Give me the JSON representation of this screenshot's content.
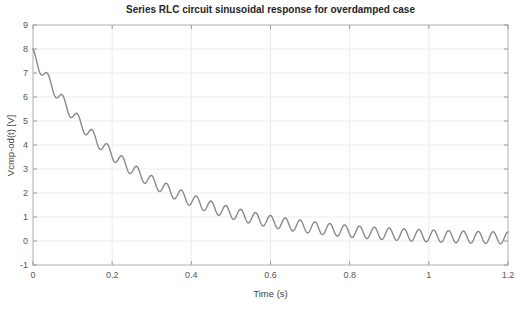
{
  "figure": {
    "kind": "matlab-style-figure",
    "background": "#ffffff"
  },
  "chart_data": {
    "type": "line",
    "title": "Series RLC circuit sinusoidal response for overdamped case",
    "xlabel": "Time (s)",
    "ylabel": "Vcmp-od(t) [V]",
    "xlim": [
      0,
      1.2
    ],
    "ylim": [
      -1,
      9
    ],
    "xticks": [
      0,
      0.2,
      0.4,
      0.6,
      0.8,
      1,
      1.2
    ],
    "xtick_labels": [
      "0",
      "0.2",
      "0.4",
      "0.6",
      "0.8",
      "1",
      "1.2"
    ],
    "yticks": [
      -1,
      0,
      1,
      2,
      3,
      4,
      5,
      6,
      7,
      8,
      9
    ],
    "ytick_labels": [
      "-1",
      "0",
      "1",
      "2",
      "3",
      "4",
      "5",
      "6",
      "7",
      "8",
      "9"
    ],
    "grid": true,
    "legend": "none",
    "series": [
      {
        "name": "Vcmp-od(t)",
        "description": "Decaying exponential transient with constant-amplitude steady-state sinusoid; starts at 8 V, settles oscillating about ~0.05 V",
        "model": "v(t) = A*exp(-t/tau) + offset + amp*sin(2*pi*freq*t + phase)",
        "params": {
          "A": 7.7,
          "tau": 0.26,
          "offset": 0.05,
          "amp": 0.25,
          "freq": 26.67,
          "phase": 1.5708
        },
        "t_start": 0,
        "t_end": 1.2,
        "n_points": 700,
        "midline_samples": {
          "t": [
            0,
            0.2,
            0.4,
            0.6,
            0.8,
            1.0,
            1.2
          ],
          "v": [
            7.75,
            3.68,
            1.77,
            0.88,
            0.45,
            0.24,
            0.13
          ]
        },
        "start_value": 8.0,
        "oscillation_amplitude": 0.25,
        "oscillation_frequency_hz": 26.67
      }
    ]
  },
  "styles": {
    "line_color": "#8a8a8a",
    "line_width": 1.4,
    "grid_color": "#ececec",
    "axis_box_color": "#b0b0b0",
    "tick_color": "#9a9a9a",
    "tick_label_color": "#575757",
    "title_color": "#262626",
    "axis_label_color": "#424242",
    "background": "#ffffff"
  }
}
